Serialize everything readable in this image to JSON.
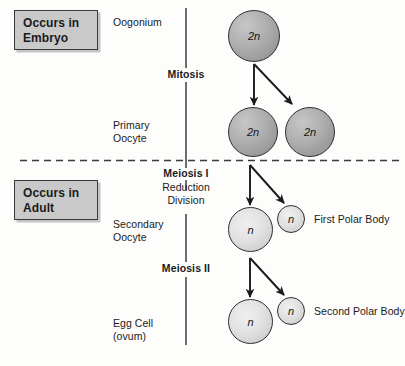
{
  "diagram": {
    "background_color": "#fdfdfc",
    "divider_color": "#3b3b3b"
  },
  "stage_boxes": [
    {
      "name": "embryo",
      "line1": "Occurs in",
      "line2": "Embryo",
      "fill": "#c9c9c9",
      "border": "#3a3a3a"
    },
    {
      "name": "adult",
      "line1": "Occurs in",
      "line2": "Adult",
      "fill": "#c9c9c9",
      "border": "#3a3a3a"
    }
  ],
  "captions": [
    {
      "name": "oogonium",
      "line1": "Oogonium",
      "line2": ""
    },
    {
      "name": "primary-oocyte",
      "line1": "Primary",
      "line2": "Oocyte"
    },
    {
      "name": "secondary-oocyte",
      "line1": "Secondary",
      "line2": "Oocyte"
    },
    {
      "name": "egg-cell",
      "line1": "Egg Cell",
      "line2": "(ovum)"
    }
  ],
  "processes": [
    {
      "name": "mitosis",
      "label": "Mitosis",
      "sub1": "",
      "sub2": ""
    },
    {
      "name": "meiosis-i",
      "label": "Meiosis I",
      "sub1": "Reduction",
      "sub2": "Division"
    },
    {
      "name": "meiosis-ii",
      "label": "Meiosis II",
      "sub1": "",
      "sub2": ""
    }
  ],
  "cells": [
    {
      "name": "oogonium-cell",
      "ploidy": "2n",
      "type": "diploid"
    },
    {
      "name": "primary-oocyte-cell",
      "ploidy": "2n",
      "type": "diploid"
    },
    {
      "name": "primary-oocyte-sister",
      "ploidy": "2n",
      "type": "diploid"
    },
    {
      "name": "secondary-oocyte-cell",
      "ploidy": "n",
      "type": "haploid"
    },
    {
      "name": "first-polar-body-cell",
      "ploidy": "n",
      "type": "haploid"
    },
    {
      "name": "egg-cell-ovum",
      "ploidy": "n",
      "type": "haploid"
    },
    {
      "name": "second-polar-body-cell",
      "ploidy": "n",
      "type": "haploid"
    }
  ],
  "side_labels": [
    {
      "name": "first-polar-body",
      "text": "First Polar Body"
    },
    {
      "name": "second-polar-body",
      "text": "Second Polar Body"
    }
  ]
}
